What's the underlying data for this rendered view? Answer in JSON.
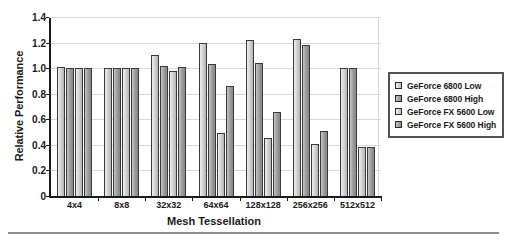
{
  "chart_data": {
    "type": "bar",
    "title": "",
    "xlabel": "Mesh Tessellation",
    "ylabel": "Relative Performance",
    "categories": [
      "4x4",
      "8x8",
      "32x32",
      "64x64",
      "128x128",
      "256x256",
      "512x512"
    ],
    "series": [
      {
        "name": "GeForce 6800 Low",
        "values": [
          1.01,
          1.0,
          1.1,
          1.2,
          1.22,
          1.23,
          1.0
        ]
      },
      {
        "name": "GeForce 6800 High",
        "values": [
          1.0,
          1.0,
          1.02,
          1.03,
          1.04,
          1.18,
          1.0
        ]
      },
      {
        "name": "GeForce FX 5600 Low",
        "values": [
          1.0,
          1.0,
          0.98,
          0.49,
          0.45,
          0.41,
          0.38
        ]
      },
      {
        "name": "GeForce FX 5600 High",
        "values": [
          1.0,
          1.0,
          1.01,
          0.86,
          0.66,
          0.51,
          0.38
        ]
      }
    ],
    "ylim": [
      0,
      1.4
    ],
    "yticks": [
      0,
      0.2,
      0.4,
      0.6,
      0.8,
      1.0,
      1.2,
      1.4
    ],
    "ytick_labels": [
      "0",
      "0.2",
      "0.4",
      "0.6",
      "0.8",
      "1.0",
      "1.2",
      "1.4"
    ],
    "grid": true,
    "legend_position": "right",
    "colors": {
      "series_light": "#d2d2d2",
      "series_dark": "#9a9a9a",
      "axis": "#1a1a1a",
      "gridline": "#d9d9d9",
      "legend_border": "#555555",
      "rule": "#8e8e8e"
    }
  },
  "legend": {
    "entries": [
      {
        "label": "GeForce 6800 Low",
        "swatch": "light"
      },
      {
        "label": "GeForce 6800 High",
        "swatch": "dark"
      },
      {
        "label": "GeForce FX 5600 Low",
        "swatch": "light"
      },
      {
        "label": "GeForce FX 5600 High",
        "swatch": "dark"
      }
    ]
  }
}
